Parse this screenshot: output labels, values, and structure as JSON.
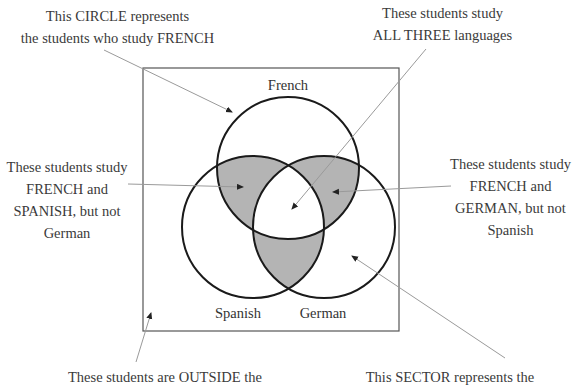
{
  "diagram": {
    "type": "venn",
    "sets": [
      {
        "name": "French",
        "label": "French"
      },
      {
        "name": "Spanish",
        "label": "Spanish"
      },
      {
        "name": "German",
        "label": "German"
      }
    ],
    "shade_color": "#b4b4b4",
    "annotations": {
      "french_circle": {
        "lines": [
          "This CIRCLE represents",
          "the students who study FRENCH"
        ]
      },
      "all_three": {
        "lines": [
          "These students study",
          "ALL THREE languages"
        ]
      },
      "french_spanish": {
        "lines": [
          "These students study",
          "FRENCH and",
          "SPANISH, but not",
          "German"
        ]
      },
      "french_german": {
        "lines": [
          "These students study",
          "FRENCH and",
          "GERMAN, but not",
          "Spanish"
        ]
      },
      "outside": {
        "lines": [
          "These students are OUTSIDE the"
        ]
      },
      "german_sector": {
        "lines": [
          "This SECTOR represents the"
        ]
      }
    }
  }
}
